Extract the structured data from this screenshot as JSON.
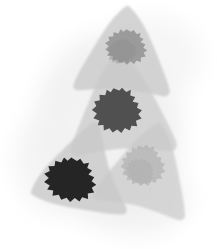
{
  "figure": {
    "title": "",
    "background_color": "#ffffff",
    "width": 217,
    "height": 249
  },
  "chart_data": {
    "type": "scatter",
    "title": "",
    "xlabel": "",
    "ylabel": "",
    "xlim": [
      0,
      217
    ],
    "ylim": [
      0,
      249
    ],
    "grid": false,
    "legend": null,
    "palette": {
      "haze": "#f0f0f0",
      "haze_edge": "#f7f7f7",
      "shape_fill": "#c9c9c9",
      "shape_fill_light": "#d6d6d6",
      "shape_overlap": "#bdbdbd",
      "blob_lightest": "#8f8f8f",
      "blob_light": "#a8a8a8",
      "blob_medium": "#4a4a4a",
      "blob_darkest": "#232323",
      "canvas": "#ffffff"
    },
    "haze": {
      "name": "background-haze",
      "color": "#f0f0f0",
      "opacity": 0.85,
      "center": [
        110,
        128
      ],
      "radius_x": 88,
      "radius_y": 110
    },
    "series": [
      {
        "name": "shape-1-top",
        "label": "Top arrowhead",
        "fill": "#c9c9c9",
        "opacity": 0.78,
        "centroid": [
          123,
          55
        ],
        "rotation_deg": 4,
        "scale": 1.0,
        "blob": {
          "name": "blob-1",
          "label": "Lightest blob",
          "fill": "#8f8f8f",
          "opacity": 0.82,
          "centroid": [
            126,
            48
          ],
          "radius": 20,
          "darkness_rank": 4
        }
      },
      {
        "name": "shape-2-middle",
        "label": "Middle arrowhead",
        "fill": "#c9c9c9",
        "opacity": 0.72,
        "centroid": [
          122,
          110
        ],
        "rotation_deg": -3,
        "scale": 1.1,
        "blob": {
          "name": "blob-2",
          "label": "Dark blob",
          "fill": "#4a4a4a",
          "opacity": 0.95,
          "centroid": [
            117,
            112
          ],
          "radius": 24,
          "darkness_rank": 2
        }
      },
      {
        "name": "shape-3-bottom-right",
        "label": "Lower-right arrowhead",
        "fill": "#c9c9c9",
        "opacity": 0.7,
        "centroid": [
          146,
          172
        ],
        "rotation_deg": 14,
        "scale": 1.0,
        "blob": {
          "name": "blob-3",
          "label": "Faint blob",
          "fill": "#a8a8a8",
          "opacity": 0.55,
          "centroid": [
            143,
            167
          ],
          "radius": 22,
          "darkness_rank": 3
        }
      },
      {
        "name": "shape-4-bottom-left",
        "label": "Lower-left arrowhead",
        "fill": "#c9c9c9",
        "opacity": 0.8,
        "centroid": [
          78,
          180
        ],
        "rotation_deg": -22,
        "scale": 1.05,
        "blob": {
          "name": "blob-4",
          "label": "Darkest blob",
          "fill": "#232323",
          "opacity": 0.98,
          "centroid": [
            70,
            181
          ],
          "radius": 25,
          "darkness_rank": 1
        }
      }
    ]
  }
}
